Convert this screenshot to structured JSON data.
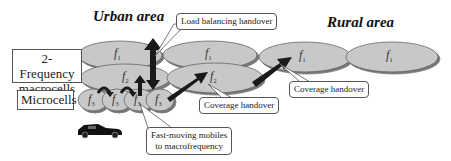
{
  "titles": {
    "urban": "Urban area",
    "rural": "Rural area"
  },
  "layer_labels": {
    "macro_line1": "2-Frequency",
    "macro_line2": "macrocells",
    "micro": "Microcells"
  },
  "callouts": {
    "load_balancing": "Load balancing handover",
    "coverage_1": "Coverage handover",
    "coverage_2": "Coverage handover",
    "fast_moving_line1": "Fast-moving mobiles",
    "fast_moving_line2": "to macrofrequency"
  },
  "cells": {
    "f1": {
      "base": "f",
      "sub": "1"
    },
    "f2": {
      "base": "f",
      "sub": "2"
    },
    "f3": {
      "base": "f",
      "sub": "3"
    }
  },
  "colors": {
    "cell_fill": "#c8c8c8",
    "cell_shadow": "#8a8a8a",
    "arrow": "#1a1a1a",
    "outline": "#555555"
  }
}
